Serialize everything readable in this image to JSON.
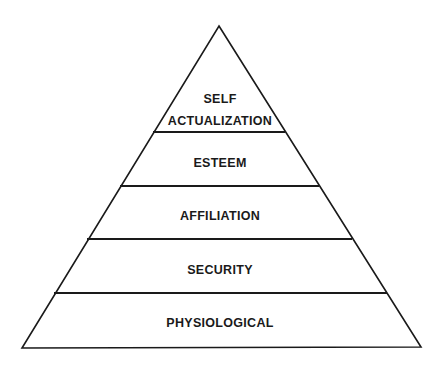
{
  "diagram": {
    "type": "pyramid",
    "levels": [
      {
        "label_line1": "SELF",
        "label_line2": "ACTUALIZATION"
      },
      {
        "label": "ESTEEM"
      },
      {
        "label": "AFFILIATION"
      },
      {
        "label": "SECURITY"
      },
      {
        "label": "PHYSIOLOGICAL"
      }
    ],
    "colors": {
      "stroke": "#1a1a1a",
      "background": "#ffffff",
      "text": "#1a1a1a"
    }
  }
}
